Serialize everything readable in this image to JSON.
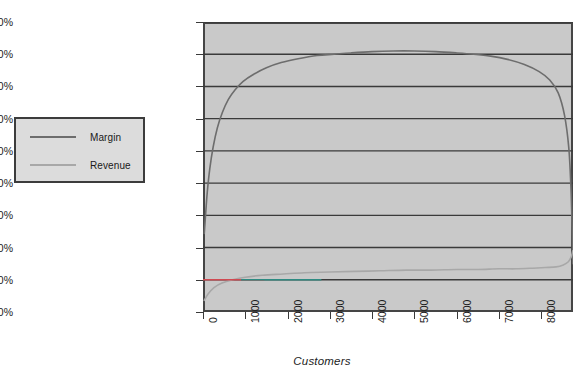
{
  "chart_data": {
    "type": "line",
    "title": "",
    "xlabel": "Customers",
    "ylabel": "",
    "xlim": [
      0,
      8750
    ],
    "ylim": [
      0,
      450
    ],
    "grid": true,
    "legend_position": "outside-left",
    "y_ticks": [
      "0%",
      "50%",
      "100%",
      "150%",
      "200%",
      "250%",
      "300%",
      "350%",
      "400%",
      "450%"
    ],
    "y_tick_values": [
      0,
      50,
      100,
      150,
      200,
      250,
      300,
      350,
      400,
      450
    ],
    "x_ticks": [
      "0",
      "1000",
      "2000",
      "3000",
      "4000",
      "5000",
      "6000",
      "7000",
      "8000"
    ],
    "x_tick_values": [
      0,
      1000,
      2000,
      3000,
      4000,
      5000,
      6000,
      7000,
      8000
    ],
    "series": [
      {
        "name": "Margin",
        "color": "#6d6d6d",
        "x": [
          30,
          60,
          100,
          160,
          240,
          340,
          460,
          600,
          760,
          950,
          1200,
          1500,
          1850,
          2250,
          2700,
          3100,
          3500,
          4000,
          4500,
          5000,
          5500,
          6000,
          6400,
          6800,
          7200,
          7600,
          7950,
          8200,
          8400,
          8550,
          8650,
          8700,
          8730,
          8745
        ],
        "values": [
          122,
          150,
          185,
          222,
          256,
          286,
          310,
          330,
          345,
          358,
          369,
          379,
          387,
          393,
          398,
          400,
          402,
          404,
          405,
          405,
          404,
          402,
          400,
          397,
          392,
          384,
          373,
          360,
          340,
          305,
          255,
          195,
          130,
          75
        ]
      },
      {
        "name": "Revenue",
        "color": "#a8a8a8",
        "x": [
          30,
          120,
          260,
          450,
          700,
          1000,
          1400,
          1900,
          2400,
          3000,
          3600,
          4200,
          4800,
          5400,
          6000,
          6500,
          7000,
          7400,
          7800,
          8100,
          8350,
          8520,
          8640,
          8710,
          8745
        ],
        "values": [
          18,
          28,
          38,
          45,
          50,
          54,
          57,
          59,
          61,
          62,
          63,
          64,
          65,
          65,
          66,
          66,
          67,
          67,
          68,
          69,
          70,
          73,
          78,
          86,
          95
        ]
      }
    ],
    "reference_lines": [
      {
        "name": "break-even-red",
        "y": 50,
        "x_start": 0,
        "x_end": 1450,
        "color": "#d04a52"
      },
      {
        "name": "break-even-teal",
        "y": 50,
        "x_start": 900,
        "x_end": 2800,
        "color": "#2e8b82"
      }
    ]
  },
  "legend": {
    "items": [
      {
        "label": "Margin",
        "color": "#6d6d6d"
      },
      {
        "label": "Revenue",
        "color": "#a8a8a8"
      }
    ]
  },
  "axis": {
    "x_title": "Customers"
  },
  "colors": {
    "plot_background": "#c9c9c9",
    "plot_border": "#454545",
    "gridline": "#3a3a3a",
    "legend_background": "#dcdcdc",
    "legend_border": "#3c3c3c",
    "text": "#1c1c1c"
  }
}
